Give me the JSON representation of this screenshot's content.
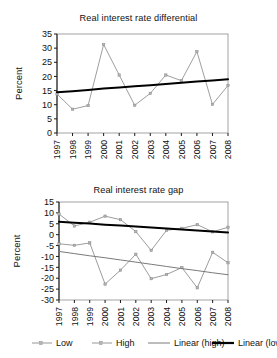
{
  "figure": {
    "background": "#ffffff",
    "panels": [
      "top",
      "bottom"
    ]
  },
  "chart_data": [
    {
      "type": "line",
      "panel": "top",
      "title": "Real interest rate differential",
      "xlabel": "",
      "ylabel": "Percent",
      "categories": [
        "1997",
        "1998",
        "1999",
        "2000",
        "2001",
        "2002",
        "2003",
        "2004",
        "2005",
        "2006",
        "2007",
        "2008"
      ],
      "x": [
        1997,
        1998,
        1999,
        2000,
        2001,
        2002,
        2003,
        2004,
        2005,
        2006,
        2007,
        2008
      ],
      "ylim": [
        0,
        35
      ],
      "yticks": [
        0,
        5,
        10,
        15,
        20,
        25,
        30,
        35
      ],
      "grid": false,
      "legend": "none",
      "series": [
        {
          "name": "Differential",
          "color": "#8c8c8c",
          "style": "solid-with-markers",
          "values": [
            13.8,
            8.4,
            9.7,
            31.3,
            20.5,
            9.8,
            14.0,
            20.5,
            18.5,
            28.8,
            10.1,
            16.8
          ]
        },
        {
          "name": "Linear trend",
          "color": "#000000",
          "style": "trend-thick",
          "values": [
            14.4,
            14.8,
            15.2,
            15.7,
            16.1,
            16.5,
            16.9,
            17.3,
            17.8,
            18.2,
            18.6,
            19.0
          ]
        }
      ]
    },
    {
      "type": "line",
      "panel": "bottom",
      "title": "Real interest rate gap",
      "xlabel": "",
      "ylabel": "Percent",
      "categories": [
        "1997",
        "1998",
        "1999",
        "2000",
        "2001",
        "2002",
        "2003",
        "2004",
        "2005",
        "2006",
        "2007",
        "2008"
      ],
      "x": [
        1997,
        1998,
        1999,
        2000,
        2001,
        2002,
        2003,
        2004,
        2005,
        2006,
        2007,
        2008
      ],
      "ylim": [
        -30,
        15
      ],
      "yticks": [
        -30,
        -25,
        -20,
        -15,
        -10,
        -5,
        0,
        5,
        10,
        15
      ],
      "grid": false,
      "legend": "below",
      "series": [
        {
          "name": "Low",
          "color": "#8a8a8a",
          "style": "solid-with-markers",
          "values": [
            -4.2,
            -4.9,
            -3.8,
            -22.7,
            -16.3,
            -9.0,
            -20.2,
            -18.3,
            -15.1,
            -24.4,
            -8.1,
            -12.9
          ]
        },
        {
          "name": "High",
          "color": "#8a8a8a",
          "style": "solid-with-markers",
          "values": [
            9.5,
            4.0,
            5.7,
            8.5,
            6.9,
            1.4,
            -7.2,
            2.0,
            2.9,
            4.6,
            1.3,
            3.4
          ]
        },
        {
          "name": "Linear (high)",
          "color": "#7a7a7a",
          "style": "trend-thin",
          "values": [
            -7.7,
            -8.7,
            -9.7,
            -10.6,
            -11.6,
            -12.6,
            -13.6,
            -14.6,
            -15.6,
            -16.5,
            -17.5,
            -18.4
          ]
        },
        {
          "name": "Linear (low)",
          "color": "#000000",
          "style": "trend-thick",
          "values": [
            5.9,
            5.5,
            5.1,
            4.6,
            4.2,
            3.7,
            3.3,
            2.8,
            2.4,
            1.9,
            1.5,
            1.0
          ]
        }
      ]
    }
  ],
  "legend": {
    "items": [
      {
        "label": "Low",
        "color": "#8a8a8a",
        "marker": "dash-marker-dash"
      },
      {
        "label": "High",
        "color": "#8a8a8a",
        "marker": "dash-marker-dash"
      },
      {
        "label": "Linear (high)",
        "color": "#7a7a7a",
        "marker": "thin-line"
      },
      {
        "label": "Linear (low)",
        "color": "#000000",
        "marker": "thick-line"
      }
    ]
  },
  "axes": {
    "top": {
      "ylabel": "Percent",
      "ymin": 0,
      "ymax": 35,
      "ystep": 5
    },
    "bottom": {
      "ylabel": "Percent",
      "ymin": -30,
      "ymax": 15,
      "ystep": 5
    }
  },
  "colors": {
    "series_gray": "#8a8a8a",
    "trend_black": "#000000",
    "trend_gray": "#7a7a7a",
    "axis": "#1a1a1a",
    "frame": "#999999"
  }
}
